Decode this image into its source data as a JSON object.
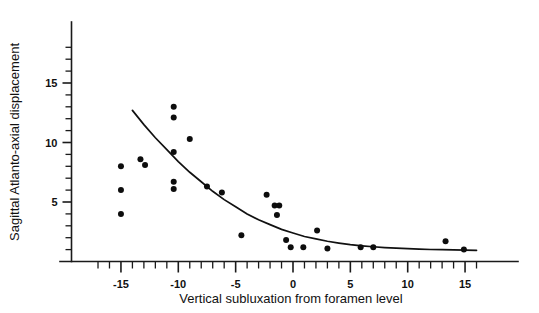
{
  "chart_data": {
    "type": "scatter",
    "title": "",
    "xlabel": "Vertical subluxation from foramen level",
    "ylabel": "Sagittal Atlanto-axial displacement",
    "xlim": [
      -18,
      17
    ],
    "ylim": [
      0,
      19
    ],
    "grid": false,
    "legend": null,
    "x_ticks_major": [
      -15,
      -10,
      -5,
      0,
      5,
      10,
      15
    ],
    "x_tick_labels": [
      "-15",
      "-10",
      "-5",
      "0",
      "5",
      "10",
      "15"
    ],
    "x_minor_tick_step": 1,
    "y_ticks_major": [
      5,
      10,
      15
    ],
    "y_tick_labels": [
      "5",
      "10",
      "15"
    ],
    "y_minor_tick_step": 1,
    "point_color": "#0d0d0d",
    "curve_color": "#111111",
    "marker_radius_px": 3,
    "points": [
      {
        "x": -15.0,
        "y": 8.0
      },
      {
        "x": -15.0,
        "y": 6.0
      },
      {
        "x": -15.0,
        "y": 4.0
      },
      {
        "x": -13.3,
        "y": 8.6
      },
      {
        "x": -12.9,
        "y": 8.1
      },
      {
        "x": -10.4,
        "y": 13.0
      },
      {
        "x": -10.4,
        "y": 12.1
      },
      {
        "x": -10.4,
        "y": 9.2
      },
      {
        "x": -10.4,
        "y": 6.7
      },
      {
        "x": -10.4,
        "y": 6.1
      },
      {
        "x": -9.0,
        "y": 10.3
      },
      {
        "x": -7.5,
        "y": 6.3
      },
      {
        "x": -6.2,
        "y": 5.8
      },
      {
        "x": -4.5,
        "y": 2.2
      },
      {
        "x": -2.3,
        "y": 5.6
      },
      {
        "x": -1.6,
        "y": 4.7
      },
      {
        "x": -1.2,
        "y": 4.7
      },
      {
        "x": -1.4,
        "y": 3.9
      },
      {
        "x": -0.6,
        "y": 1.8
      },
      {
        "x": -0.2,
        "y": 1.2
      },
      {
        "x": 0.9,
        "y": 1.2
      },
      {
        "x": 2.1,
        "y": 2.6
      },
      {
        "x": 3.0,
        "y": 1.1
      },
      {
        "x": 5.9,
        "y": 1.2
      },
      {
        "x": 7.0,
        "y": 1.2
      },
      {
        "x": 13.3,
        "y": 1.7
      },
      {
        "x": 14.9,
        "y": 1.0
      }
    ],
    "fit_curve": {
      "label": "fitted exponential decay curve",
      "x_start": -14.0,
      "x_end": 16.0,
      "points": [
        {
          "x": -14.0,
          "y": 12.7
        },
        {
          "x": -13.0,
          "y": 11.5
        },
        {
          "x": -12.0,
          "y": 10.4
        },
        {
          "x": -11.0,
          "y": 9.4
        },
        {
          "x": -10.0,
          "y": 8.4
        },
        {
          "x": -9.0,
          "y": 7.5
        },
        {
          "x": -8.0,
          "y": 6.7
        },
        {
          "x": -7.0,
          "y": 5.9
        },
        {
          "x": -6.0,
          "y": 5.2
        },
        {
          "x": -5.0,
          "y": 4.6
        },
        {
          "x": -4.0,
          "y": 4.0
        },
        {
          "x": -3.0,
          "y": 3.5
        },
        {
          "x": -2.0,
          "y": 3.1
        },
        {
          "x": -1.0,
          "y": 2.7
        },
        {
          "x": 0.0,
          "y": 2.4
        },
        {
          "x": 1.0,
          "y": 2.1
        },
        {
          "x": 2.0,
          "y": 1.9
        },
        {
          "x": 3.0,
          "y": 1.7
        },
        {
          "x": 4.0,
          "y": 1.55
        },
        {
          "x": 5.0,
          "y": 1.42
        },
        {
          "x": 6.0,
          "y": 1.32
        },
        {
          "x": 7.0,
          "y": 1.24
        },
        {
          "x": 8.0,
          "y": 1.17
        },
        {
          "x": 9.0,
          "y": 1.12
        },
        {
          "x": 10.0,
          "y": 1.08
        },
        {
          "x": 11.0,
          "y": 1.04
        },
        {
          "x": 12.0,
          "y": 1.01
        },
        {
          "x": 13.0,
          "y": 0.99
        },
        {
          "x": 14.0,
          "y": 0.97
        },
        {
          "x": 15.0,
          "y": 0.95
        },
        {
          "x": 16.0,
          "y": 0.94
        }
      ]
    }
  },
  "axes": {
    "x_title": "Vertical subluxation from foramen level",
    "y_title": "Sagittal Atlanto-axial displacement"
  }
}
